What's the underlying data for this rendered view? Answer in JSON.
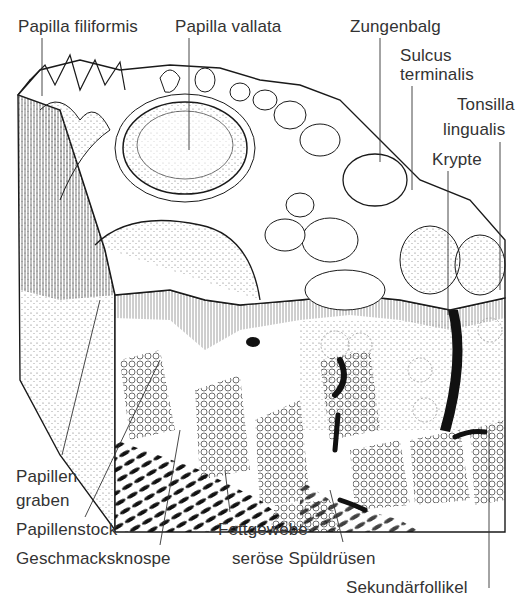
{
  "figure": {
    "labels": {
      "papilla_filiformis": "Papilla filiformis",
      "papilla_vallata": "Papilla vallata",
      "zungenbalg": "Zungenbalg",
      "sulcus_line1": "Sulcus",
      "sulcus_line2": "terminalis",
      "tonsilla_line1": "Tonsilla",
      "tonsilla_line2": "lingualis",
      "krypte": "Krypte",
      "papillen_line1": "Papillen",
      "papillen_line2": "graben",
      "papillenstock": "Papillenstock",
      "geschmacksknospe": "Geschmacksknospe",
      "fettgewebe": "Fettgewebe",
      "seroese_spueldruesen": "seröse Spüldrüsen",
      "sekundaerfollikel": "Sekundärfollikel"
    },
    "colors": {
      "ink": "#1a1a1a",
      "text": "#333333",
      "paper": "#ffffff",
      "stipple": "#777777"
    }
  }
}
